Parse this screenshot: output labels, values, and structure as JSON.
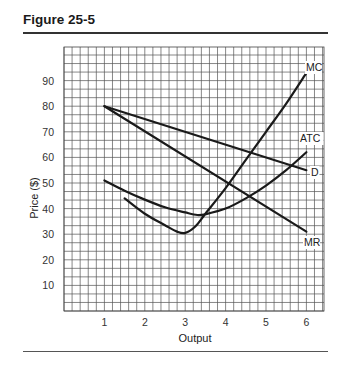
{
  "figure": {
    "title": "Figure 25-5"
  },
  "chart_data": {
    "type": "line",
    "title": "Figure 25-5",
    "xlabel": "Output",
    "ylabel": "Price ($)",
    "xlim": [
      0,
      6.4
    ],
    "ylim": [
      0,
      103
    ],
    "x_ticks": [
      1,
      2,
      3,
      4,
      5,
      6
    ],
    "y_ticks": [
      10,
      20,
      30,
      40,
      50,
      60,
      70,
      80,
      90
    ],
    "grid": true,
    "legend": "inline labels at curve ends",
    "series": [
      {
        "name": "D",
        "x": [
          1,
          6
        ],
        "y": [
          80,
          55
        ]
      },
      {
        "name": "MR",
        "x": [
          1,
          6
        ],
        "y": [
          80,
          31
        ]
      },
      {
        "name": "ATC",
        "x": [
          1,
          1.5,
          2,
          2.5,
          3,
          3.3,
          3.5,
          4,
          4.5,
          5,
          5.5,
          6
        ],
        "y": [
          51,
          47,
          43.5,
          40.5,
          38.5,
          37.5,
          37.8,
          40,
          44,
          49,
          55,
          62
        ]
      },
      {
        "name": "MC",
        "x": [
          1.5,
          2,
          2.5,
          2.8,
          3,
          3.25,
          3.5,
          4,
          4.5,
          5,
          5.5,
          6
        ],
        "y": [
          44,
          38,
          33.5,
          31,
          30.5,
          33,
          38,
          48,
          59,
          70,
          81,
          93
        ]
      }
    ]
  },
  "labels": {
    "MC": "MC",
    "ATC": "ATC",
    "D": "D",
    "MR": "MR"
  }
}
